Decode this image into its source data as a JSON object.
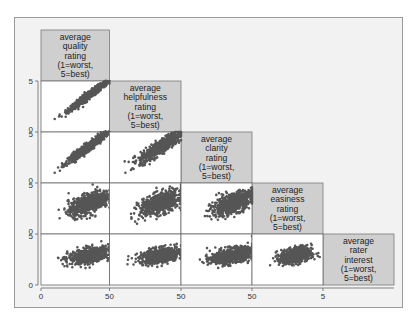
{
  "chart_data": {
    "type": "scatter-matrix",
    "title": "",
    "variables": [
      {
        "name": "quality",
        "label_lines": [
          "average",
          "quality",
          "rating",
          "(1=worst,",
          "5=best)"
        ]
      },
      {
        "name": "helpfulness",
        "label_lines": [
          "average",
          "helpfulness",
          "rating",
          "(1=worst,",
          "5=best)"
        ]
      },
      {
        "name": "clarity",
        "label_lines": [
          "average",
          "clarity",
          "rating",
          "(1=worst,",
          "5=best)"
        ]
      },
      {
        "name": "easiness",
        "label_lines": [
          "average",
          "easiness",
          "rating",
          "(1=worst,",
          "5=best)"
        ]
      },
      {
        "name": "rater_interest",
        "label_lines": [
          "average",
          "rater",
          "interest",
          "(1=worst,",
          "5=best)"
        ]
      }
    ],
    "axis_range": [
      0,
      5
    ],
    "x_tick_labels": [
      "0",
      "50",
      "50",
      "50",
      "5"
    ],
    "y_tick_labels": [
      "5",
      "0 5",
      "0 5",
      "0 5",
      "0"
    ],
    "grid": false,
    "legend": "none",
    "point_color": "#555555",
    "label_box_color": "#cfcfcf",
    "panels": [
      {
        "row": 2,
        "col": 1,
        "x": "quality",
        "y": "helpfulness",
        "relation": "strong positive",
        "x_center": 3.5,
        "y_center": 3.6,
        "x_sd": 0.75,
        "y_sd": 0.75,
        "corr": 0.97,
        "n": 700
      },
      {
        "row": 3,
        "col": 1,
        "x": "quality",
        "y": "clarity",
        "relation": "strong positive",
        "x_center": 3.5,
        "y_center": 3.6,
        "x_sd": 0.75,
        "y_sd": 0.75,
        "corr": 0.96,
        "n": 700
      },
      {
        "row": 3,
        "col": 2,
        "x": "helpfulness",
        "y": "clarity",
        "relation": "strong positive",
        "x_center": 3.6,
        "y_center": 3.6,
        "x_sd": 0.75,
        "y_sd": 0.75,
        "corr": 0.88,
        "n": 700
      },
      {
        "row": 4,
        "col": 1,
        "x": "quality",
        "y": "easiness",
        "relation": "moderate positive",
        "x_center": 3.5,
        "y_center": 3.0,
        "x_sd": 0.75,
        "y_sd": 0.6,
        "corr": 0.6,
        "n": 700
      },
      {
        "row": 4,
        "col": 2,
        "x": "helpfulness",
        "y": "easiness",
        "relation": "moderate positive",
        "x_center": 3.6,
        "y_center": 3.0,
        "x_sd": 0.75,
        "y_sd": 0.6,
        "corr": 0.55,
        "n": 700
      },
      {
        "row": 4,
        "col": 3,
        "x": "clarity",
        "y": "easiness",
        "relation": "moderate positive",
        "x_center": 3.6,
        "y_center": 3.0,
        "x_sd": 0.75,
        "y_sd": 0.6,
        "corr": 0.6,
        "n": 700
      },
      {
        "row": 5,
        "col": 1,
        "x": "quality",
        "y": "rater_interest",
        "relation": "weak positive",
        "x_center": 3.5,
        "y_center": 2.9,
        "x_sd": 0.75,
        "y_sd": 0.4,
        "corr": 0.45,
        "n": 700
      },
      {
        "row": 5,
        "col": 2,
        "x": "helpfulness",
        "y": "rater_interest",
        "relation": "weak positive",
        "x_center": 3.6,
        "y_center": 2.9,
        "x_sd": 0.75,
        "y_sd": 0.4,
        "corr": 0.42,
        "n": 700
      },
      {
        "row": 5,
        "col": 3,
        "x": "clarity",
        "y": "rater_interest",
        "relation": "weak positive",
        "x_center": 3.6,
        "y_center": 2.9,
        "x_sd": 0.75,
        "y_sd": 0.4,
        "corr": 0.45,
        "n": 700
      },
      {
        "row": 5,
        "col": 4,
        "x": "easiness",
        "y": "rater_interest",
        "relation": "weak positive",
        "x_center": 3.1,
        "y_center": 2.9,
        "x_sd": 0.55,
        "y_sd": 0.4,
        "corr": 0.3,
        "n": 700
      }
    ]
  }
}
